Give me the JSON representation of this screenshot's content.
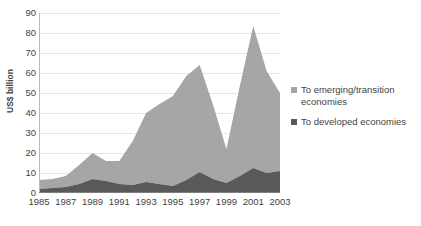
{
  "chart_data": {
    "type": "area",
    "stacked": true,
    "title": "",
    "xlabel": "",
    "ylabel": "US$ billion",
    "ylim": [
      0,
      90
    ],
    "ytick_step": 10,
    "yticks": [
      0,
      10,
      20,
      30,
      40,
      50,
      60,
      70,
      80,
      90
    ],
    "grid": true,
    "legend_position": "right",
    "x": [
      1985,
      1986,
      1987,
      1988,
      1989,
      1990,
      1991,
      1992,
      1993,
      1994,
      1995,
      1996,
      1997,
      1998,
      1999,
      2000,
      2001,
      2002,
      2003
    ],
    "xtick_labels": [
      "1985",
      "1987",
      "1989",
      "1991",
      "1993",
      "1995",
      "1997",
      "1999",
      "2001",
      "2003"
    ],
    "xticks": [
      1985,
      1987,
      1989,
      1991,
      1993,
      1995,
      1997,
      1999,
      2001,
      2003
    ],
    "series": [
      {
        "name": "To developed economies",
        "color": "#595959",
        "values": [
          2,
          2.5,
          3,
          4.5,
          7,
          6,
          4.5,
          4,
          5.5,
          4.5,
          3.5,
          6.5,
          10.5,
          7,
          5,
          8.5,
          12.5,
          10,
          11
        ]
      },
      {
        "name": "To emerging/transition economies",
        "color": "#a6a6a6",
        "values": [
          4.5,
          4.5,
          5.5,
          9.5,
          13,
          10,
          11.5,
          22,
          34.5,
          40,
          45,
          52,
          53.5,
          37,
          17,
          45,
          71,
          51,
          39
        ]
      }
    ],
    "totals": [
      6.5,
      7,
      8.5,
      14,
      20,
      16,
      16,
      26,
      40,
      44.5,
      48.5,
      58.5,
      64,
      44,
      22,
      53.5,
      83.5,
      61,
      50
    ]
  },
  "legend": {
    "items": [
      {
        "label_line1": "To emerging/transition",
        "label_line2": "economies",
        "color": "#a6a6a6"
      },
      {
        "label_line1": "To developed economies",
        "label_line2": "",
        "color": "#595959"
      }
    ]
  }
}
